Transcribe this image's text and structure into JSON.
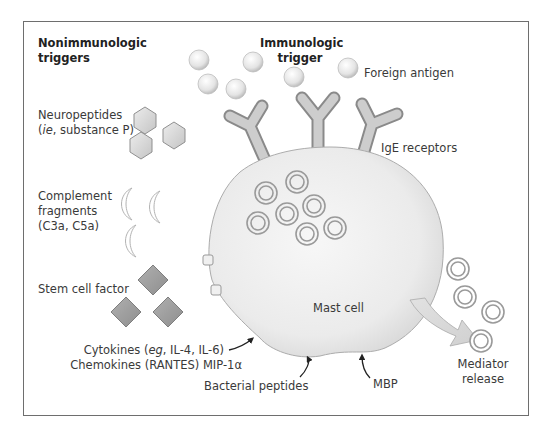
{
  "headings": {
    "nonimmunologic_line1": "Nonimmunologic",
    "nonimmunologic_line2": "triggers",
    "immunologic_line1": "Immunologic",
    "immunologic_line2": "trigger"
  },
  "labels": {
    "foreign_antigen": "Foreign antigen",
    "ige_receptors": "IgE receptors",
    "neuropeptides_line1": "Neuropeptides",
    "neuropeptides_line2_italic": "ie",
    "neuropeptides_line2_rest": ", substance P)",
    "neuropeptides_line2_open": "(",
    "complement_line1": "Complement",
    "complement_line2": "fragments",
    "complement_line3": "(C3a, C5a)",
    "stem_cell_factor": "Stem cell factor",
    "mast_cell": "Mast cell",
    "cytokines_open": "Cytokines (",
    "cytokines_italic": "eg",
    "cytokines_rest": ", IL-4, IL-6)",
    "chemokines": "Chemokines (RANTES) MIP-1α",
    "bacterial_peptides": "Bacterial peptides",
    "mbp": "MBP",
    "mediator_line1": "Mediator",
    "mediator_line2": "release"
  },
  "icons": {
    "antigen": "sphere",
    "ige_receptor": "y-shaped-antibody",
    "neuropeptide": "hexagon",
    "complement": "crescent",
    "stem_cell_factor": "diamond",
    "granule": "double-ring",
    "receptor_box": "rounded-square"
  },
  "colors": {
    "frame": "#6e6e6e",
    "cell_fill": "#ececec",
    "cell_stroke": "#a8a8a8",
    "receptor": "#b4b4b4",
    "diamond": "#9c9c9c",
    "granule": "#9a9a9a",
    "arrow": "#222222"
  }
}
